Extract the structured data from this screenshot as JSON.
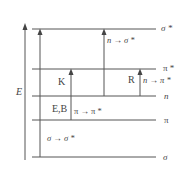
{
  "diagram": {
    "type": "energy-level-diagram",
    "axis_label": "E",
    "levels": [
      {
        "name": "sigma-star",
        "label": "σ *",
        "y": 29
      },
      {
        "name": "pi-star",
        "label": "π *",
        "y": 69
      },
      {
        "name": "n",
        "label": "n",
        "y": 96
      },
      {
        "name": "pi",
        "label": "π",
        "y": 120
      },
      {
        "name": "sigma",
        "label": "σ",
        "y": 157
      }
    ],
    "transitions": [
      {
        "name": "sigma-to-sigma-star",
        "label": "σ → σ *",
        "from": "σ",
        "to": "σ *"
      },
      {
        "name": "n-to-sigma-star",
        "label": "n → σ *",
        "from": "n",
        "to": "σ *"
      },
      {
        "name": "pi-to-pi-star",
        "label": "π → π *",
        "from": "π",
        "to": "π *"
      },
      {
        "name": "n-to-pi-star",
        "label": "n → π *",
        "from": "n",
        "to": "π *"
      }
    ],
    "bands": [
      {
        "name": "band-K",
        "label": "K"
      },
      {
        "name": "band-R",
        "label": "R"
      },
      {
        "name": "band-EB",
        "label": "E,B"
      }
    ],
    "colors": {
      "line": "#555555",
      "text": "#444444"
    }
  }
}
